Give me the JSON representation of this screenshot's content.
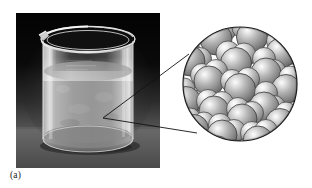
{
  "figure": {
    "panel_label": "(a)",
    "background_color": "#ffffff"
  },
  "photo": {
    "name": "beaker-photograph",
    "alt_text": "glass beaker containing liquid on a dark background",
    "frame": {
      "x": 16,
      "y": 13,
      "width": 144,
      "height": 155
    },
    "background_top_color": "#070707",
    "background_bottom_color": "#6b6b6b",
    "surface_color": "#5a5a5a",
    "beaker": {
      "glass_color": "#b9b9b9",
      "liquid_color": "#8e8e8e",
      "highlight_color": "#f2f2f2",
      "rim_color": "#e8e8e8",
      "has_spout": true
    }
  },
  "inset": {
    "name": "magnified-molecular-view",
    "alt_text": "circular magnified view of water molecules packed together in the liquid state",
    "circle": {
      "center_x": 240,
      "center_y": 84,
      "radius": 57
    },
    "outline_color": "#1c1c1c",
    "fill_color": "#ffffff",
    "molecule": {
      "label": "water molecule",
      "oxygen_color": "#9a9a9a",
      "hydrogen_color": "#a6a6a6",
      "highlight_color": "#f0f0f0",
      "shadow_color": "#4a4a4a",
      "edge_color": "#3a3a3a"
    },
    "molecule_count": 27
  },
  "leaders": {
    "name": "magnification-leader-lines",
    "color": "#121212",
    "width": 0.9,
    "apex_x": 103,
    "apex_y": 118,
    "upper_end_x": 189,
    "upper_end_y": 54,
    "lower_end_x": 197,
    "lower_end_y": 133
  }
}
